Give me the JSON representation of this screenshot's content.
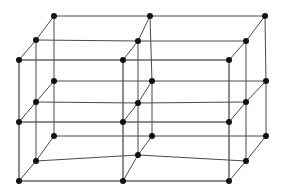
{
  "figure": {
    "canvas": {
      "width": 283,
      "height": 190
    },
    "background_color": "#ffffff",
    "edge_color": "#1a1a1a",
    "depth_edge_color": "#4a4a4a",
    "node_color": "#111111",
    "node_radius": 3,
    "edge_width": 1
  },
  "chart_data": {
    "type": "scatter",
    "xlabel": "",
    "ylabel": "",
    "projection": "oblique",
    "grid": false,
    "legend": "none",
    "lattice": {
      "dimensions": [
        3,
        3,
        3
      ],
      "total_nodes": 27,
      "front_face_x": [
        19,
        123,
        229
      ],
      "front_face_y": [
        60,
        122,
        181
      ],
      "depth_offsets": [
        [
          0,
          0
        ],
        [
          17,
          -20
        ],
        [
          35,
          -44
        ]
      ]
    },
    "nodes": [
      {
        "i": 0,
        "j": 0,
        "k": 0,
        "x": 19,
        "y": 60
      },
      {
        "i": 1,
        "j": 0,
        "k": 0,
        "x": 123,
        "y": 60
      },
      {
        "i": 2,
        "j": 0,
        "k": 0,
        "x": 229,
        "y": 60
      },
      {
        "i": 0,
        "j": 1,
        "k": 0,
        "x": 19,
        "y": 122
      },
      {
        "i": 1,
        "j": 1,
        "k": 0,
        "x": 123,
        "y": 122
      },
      {
        "i": 2,
        "j": 1,
        "k": 0,
        "x": 229,
        "y": 122
      },
      {
        "i": 0,
        "j": 2,
        "k": 0,
        "x": 19,
        "y": 181
      },
      {
        "i": 1,
        "j": 2,
        "k": 0,
        "x": 123,
        "y": 181
      },
      {
        "i": 2,
        "j": 2,
        "k": 0,
        "x": 229,
        "y": 181
      },
      {
        "i": 0,
        "j": 0,
        "k": 1,
        "x": 36,
        "y": 40
      },
      {
        "i": 1,
        "j": 0,
        "k": 1,
        "x": 138,
        "y": 41
      },
      {
        "i": 2,
        "j": 0,
        "k": 1,
        "x": 246,
        "y": 41
      },
      {
        "i": 0,
        "j": 1,
        "k": 1,
        "x": 36,
        "y": 102
      },
      {
        "i": 1,
        "j": 1,
        "k": 1,
        "x": 138,
        "y": 103
      },
      {
        "i": 2,
        "j": 1,
        "k": 1,
        "x": 246,
        "y": 102
      },
      {
        "i": 0,
        "j": 2,
        "k": 1,
        "x": 36,
        "y": 161
      },
      {
        "i": 1,
        "j": 2,
        "k": 1,
        "x": 138,
        "y": 155
      },
      {
        "i": 2,
        "j": 2,
        "k": 1,
        "x": 246,
        "y": 161
      },
      {
        "i": 0,
        "j": 0,
        "k": 2,
        "x": 54,
        "y": 16
      },
      {
        "i": 1,
        "j": 0,
        "k": 2,
        "x": 150,
        "y": 16
      },
      {
        "i": 2,
        "j": 0,
        "k": 2,
        "x": 265,
        "y": 16
      },
      {
        "i": 0,
        "j": 1,
        "k": 2,
        "x": 54,
        "y": 81
      },
      {
        "i": 1,
        "j": 1,
        "k": 2,
        "x": 152,
        "y": 81
      },
      {
        "i": 2,
        "j": 1,
        "k": 2,
        "x": 266,
        "y": 81
      },
      {
        "i": 0,
        "j": 2,
        "k": 2,
        "x": 54,
        "y": 136
      },
      {
        "i": 1,
        "j": 2,
        "k": 2,
        "x": 152,
        "y": 136
      },
      {
        "i": 2,
        "j": 2,
        "k": 2,
        "x": 266,
        "y": 136
      }
    ],
    "visible_node_count": 27,
    "edge_count": 54
  }
}
